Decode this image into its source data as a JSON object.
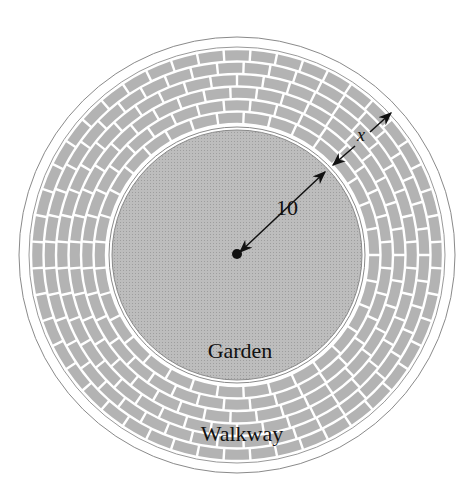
{
  "diagram": {
    "center": {
      "x": 237,
      "y": 255
    },
    "outer_radius": 218,
    "walkway_outer_radius": 208,
    "garden_radius": 125,
    "colors": {
      "background": "#ffffff",
      "brick": "#b3b3b3",
      "mortar": "#ffffff",
      "garden": "#b8b8b8",
      "outline": "#8a8a8a",
      "ink": "#111111"
    },
    "labels": {
      "garden": "Garden",
      "walkway": "Walkway",
      "radius": "10",
      "width": "x"
    }
  }
}
